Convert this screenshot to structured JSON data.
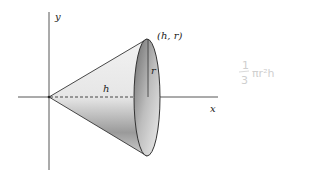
{
  "diagram": {
    "type": "cone-of-revolution",
    "labels": {
      "y_axis": "y",
      "x_axis": "x",
      "height": "h",
      "radius": "r",
      "point": "(h, r)"
    },
    "annotation": {
      "numerator": "1",
      "denominator": "3",
      "expression": "πr²h"
    }
  }
}
